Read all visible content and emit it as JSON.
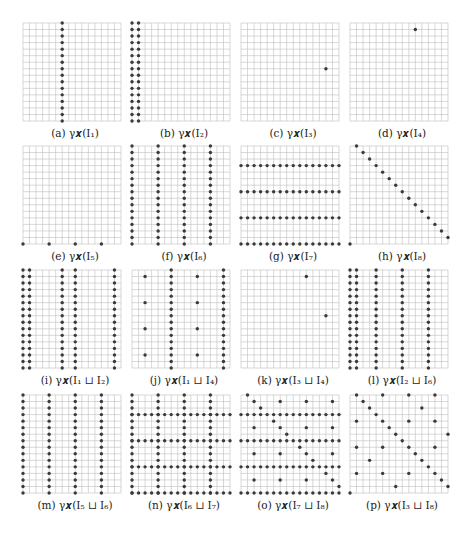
{
  "figure": {
    "grid_size": 16,
    "colors": {
      "grid": "#bdbdbd",
      "dot": "#3a3a3a",
      "caption": "#222222"
    },
    "panels": [
      {
        "id": "a",
        "caption": "(a) γ𝒙(I₁)",
        "columns": [
          6
        ],
        "rows": [],
        "points": []
      },
      {
        "id": "b",
        "caption": "(b) γ𝒙(I₂)",
        "columns": [
          0,
          1
        ],
        "rows": [],
        "points": []
      },
      {
        "id": "c",
        "caption": "(c) γ𝒙(I₃)",
        "columns": [],
        "rows": [],
        "points": [
          [
            13,
            7
          ]
        ]
      },
      {
        "id": "d",
        "caption": "(d) γ𝒙(I₄)",
        "columns": [],
        "rows": [],
        "points": [
          [
            10,
            1
          ]
        ]
      },
      {
        "id": "e",
        "caption": "(e) γ𝒙(I₅)",
        "columns": [],
        "rows": [],
        "points": [
          [
            0,
            15
          ],
          [
            4,
            15
          ],
          [
            8,
            15
          ],
          [
            12,
            15
          ]
        ]
      },
      {
        "id": "f",
        "caption": "(f) γ𝒙(I₆)",
        "columns": [
          0,
          4,
          8,
          12
        ],
        "rows": [],
        "points": []
      },
      {
        "id": "g",
        "caption": "(g) γ𝒙(I₇)",
        "columns": [],
        "rows": [
          3,
          7,
          11,
          15
        ],
        "points": []
      },
      {
        "id": "h",
        "caption": "(h) γ𝒙(I₈)",
        "columns": [],
        "rows": [],
        "points": [
          [
            1,
            0
          ],
          [
            2,
            1
          ],
          [
            3,
            2
          ],
          [
            4,
            3
          ],
          [
            5,
            4
          ],
          [
            6,
            5
          ],
          [
            7,
            6
          ],
          [
            8,
            7
          ],
          [
            9,
            8
          ],
          [
            10,
            9
          ],
          [
            11,
            10
          ],
          [
            12,
            11
          ],
          [
            13,
            12
          ],
          [
            14,
            13
          ],
          [
            15,
            14
          ],
          [
            0,
            15
          ]
        ]
      },
      {
        "id": "i",
        "caption": "(i) γ𝒙(I₁ ⊔ I₂)",
        "columns": [
          0,
          1,
          6,
          8,
          14
        ],
        "rows": [],
        "points": []
      },
      {
        "id": "j",
        "caption": "(j) γ𝒙(I₁ ⊔ I₄)",
        "columns": [
          6,
          14
        ],
        "rows": [],
        "points": [
          [
            2,
            1
          ],
          [
            10,
            1
          ],
          [
            2,
            5
          ],
          [
            10,
            5
          ],
          [
            2,
            9
          ],
          [
            10,
            9
          ],
          [
            2,
            13
          ],
          [
            10,
            13
          ]
        ]
      },
      {
        "id": "k",
        "caption": "(k) γ𝒙(I₃ ⊔ I₄)",
        "columns": [],
        "rows": [],
        "points": [
          [
            10,
            1
          ],
          [
            13,
            7
          ]
        ]
      },
      {
        "id": "l",
        "caption": "(l) γ𝒙(I₂ ⊔ I₆)",
        "columns": [
          0,
          1,
          4,
          8,
          12
        ],
        "rows": [],
        "points": []
      },
      {
        "id": "m",
        "caption": "(m) γ𝒙(I₅ ⊔ I₆)",
        "columns": [
          0,
          4,
          8,
          12
        ],
        "rows": [],
        "points": []
      },
      {
        "id": "n",
        "caption": "(n) γ𝒙(I₆ ⊔ I₇)",
        "columns": [
          0,
          4,
          8,
          12
        ],
        "rows": [
          3,
          7,
          11,
          15
        ],
        "points": []
      },
      {
        "id": "o",
        "caption": "(o) γ𝒙(I₇ ⊔ I₈)",
        "columns": [],
        "rows": [
          3,
          7,
          11,
          15
        ],
        "points": [
          [
            1,
            0
          ],
          [
            2,
            1
          ],
          [
            3,
            2
          ],
          [
            5,
            4
          ],
          [
            6,
            5
          ],
          [
            7,
            6
          ],
          [
            9,
            8
          ],
          [
            10,
            9
          ],
          [
            11,
            10
          ],
          [
            13,
            12
          ],
          [
            14,
            13
          ],
          [
            15,
            14
          ],
          [
            6,
            1
          ],
          [
            10,
            1
          ],
          [
            14,
            1
          ],
          [
            2,
            5
          ],
          [
            10,
            5
          ],
          [
            14,
            5
          ],
          [
            2,
            9
          ],
          [
            6,
            9
          ],
          [
            14,
            9
          ],
          [
            2,
            13
          ],
          [
            6,
            13
          ],
          [
            10,
            13
          ]
        ]
      },
      {
        "id": "p",
        "caption": "(p) γ𝒙(I₃ ⊔ I₈)",
        "columns": [],
        "rows": [],
        "points": [
          [
            1,
            0
          ],
          [
            5,
            0
          ],
          [
            9,
            0
          ],
          [
            13,
            0
          ],
          [
            2,
            1
          ],
          [
            3,
            2
          ],
          [
            11,
            2
          ],
          [
            4,
            3
          ],
          [
            1,
            4
          ],
          [
            5,
            4
          ],
          [
            9,
            4
          ],
          [
            13,
            4
          ],
          [
            6,
            5
          ],
          [
            7,
            6
          ],
          [
            15,
            6
          ],
          [
            8,
            7
          ],
          [
            1,
            8
          ],
          [
            5,
            8
          ],
          [
            9,
            8
          ],
          [
            13,
            8
          ],
          [
            10,
            9
          ],
          [
            3,
            10
          ],
          [
            11,
            10
          ],
          [
            12,
            11
          ],
          [
            1,
            12
          ],
          [
            5,
            12
          ],
          [
            9,
            12
          ],
          [
            13,
            12
          ],
          [
            14,
            13
          ],
          [
            7,
            14
          ],
          [
            15,
            14
          ],
          [
            0,
            15
          ]
        ]
      }
    ]
  }
}
